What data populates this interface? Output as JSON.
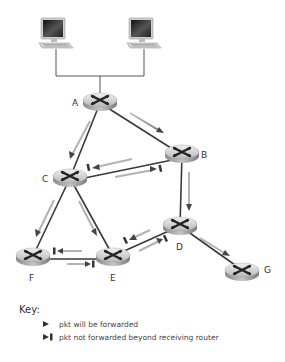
{
  "diagram": {
    "nodes": [
      {
        "id": "A",
        "label": "A",
        "x": 100,
        "y": 103
      },
      {
        "id": "B",
        "label": "B",
        "x": 182,
        "y": 155
      },
      {
        "id": "C",
        "label": "C",
        "x": 70,
        "y": 178
      },
      {
        "id": "D",
        "label": "D",
        "x": 180,
        "y": 226
      },
      {
        "id": "E",
        "label": "E",
        "x": 113,
        "y": 256
      },
      {
        "id": "F",
        "label": "F",
        "x": 33,
        "y": 256
      },
      {
        "id": "G",
        "label": "G",
        "x": 242,
        "y": 270
      }
    ],
    "hosts": [
      {
        "id": "host-1",
        "icon": "desktop-computer-icon",
        "x": 55,
        "y": 35
      },
      {
        "id": "host-2",
        "icon": "desktop-computer-icon",
        "x": 143,
        "y": 35
      }
    ],
    "links": [
      [
        "A",
        "B"
      ],
      [
        "A",
        "C"
      ],
      [
        "B",
        "C"
      ],
      [
        "B",
        "D"
      ],
      [
        "C",
        "F"
      ],
      [
        "C",
        "E"
      ],
      [
        "D",
        "E"
      ],
      [
        "D",
        "G"
      ],
      [
        "E",
        "F"
      ]
    ],
    "forwarded_arrows": [
      {
        "from": "A",
        "to": "B"
      },
      {
        "from": "A",
        "to": "C"
      },
      {
        "from": "B",
        "to": "D"
      },
      {
        "from": "C",
        "to": "F"
      },
      {
        "from": "C",
        "to": "E"
      },
      {
        "from": "D",
        "to": "G"
      }
    ],
    "blocked_arrows": [
      {
        "from": "B",
        "to": "C"
      },
      {
        "from": "C",
        "to": "B"
      },
      {
        "from": "D",
        "to": "E"
      },
      {
        "from": "E",
        "to": "D"
      },
      {
        "from": "E",
        "to": "F"
      },
      {
        "from": "F",
        "to": "E"
      }
    ],
    "colors": {
      "link": "#3a3a3a",
      "arrow": "#5a5a5a",
      "router_top": "#d8d8d8",
      "router_side": "#9a9a9a",
      "text": "#333333"
    }
  },
  "key": {
    "title": "Key:",
    "items": [
      {
        "symbol": "arrow-icon",
        "label": "pkt will be forwarded"
      },
      {
        "symbol": "arrow-blocked-icon",
        "label": "pkt not forwarded beyond receiving router"
      }
    ]
  }
}
